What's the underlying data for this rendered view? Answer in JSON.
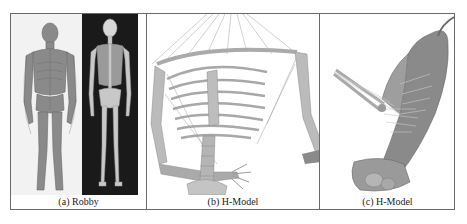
{
  "figure": {
    "panels": [
      {
        "id": "a",
        "caption": "(a) Robby",
        "description": "Full-body musculoskeletal human model, front view with muscles (light background) and back view skeleton (dark background)"
      },
      {
        "id": "b",
        "caption": "(b) H-Model",
        "description": "Upper-body skeleton with rib cage, spine, shoulder and arm with muscle lines"
      },
      {
        "id": "c",
        "caption": "(c) H-Model",
        "description": "Side view of torso with back muscles, spine and raised arm"
      }
    ],
    "colors": {
      "border": "#6a6a6a",
      "dark_panel_bg": "#1a1a1a",
      "bone": "#c8c8c8",
      "muscle": "#7a7a7a"
    }
  }
}
